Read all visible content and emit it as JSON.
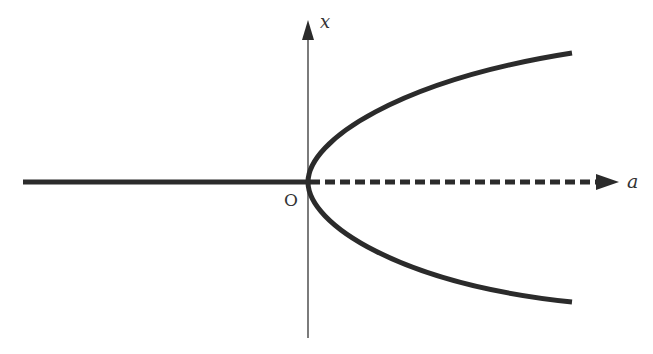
{
  "diagram": {
    "type": "pitchfork-bifurcation",
    "axes": {
      "horizontal_label": "a",
      "vertical_label": "x",
      "origin_label": "O"
    },
    "branches": [
      {
        "name": "stable-left",
        "description": "x = 0 for a < 0",
        "style": "solid"
      },
      {
        "name": "unstable-right",
        "description": "x = 0 for a > 0",
        "style": "dashed"
      },
      {
        "name": "upper-branch",
        "description": "x = +sqrt(a)",
        "style": "solid"
      },
      {
        "name": "lower-branch",
        "description": "x = -sqrt(a)",
        "style": "solid"
      }
    ],
    "colors": {
      "curve": "#2b2b2b",
      "axis": "#444444",
      "background": "#ffffff"
    }
  }
}
